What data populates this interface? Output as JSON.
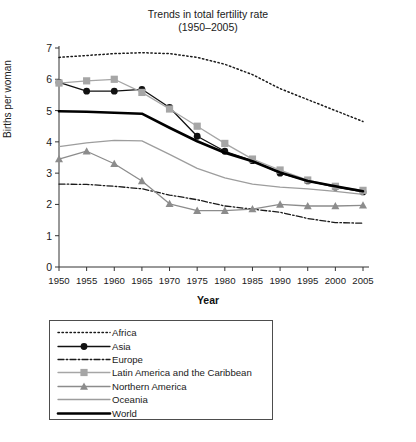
{
  "chart_data": {
    "type": "line",
    "title": "Trends in total fertility rate",
    "subtitle": "(1950–2005)",
    "xlabel": "Year",
    "ylabel": "Births per woman",
    "xlim": [
      1950,
      2005
    ],
    "ylim": [
      0,
      7
    ],
    "ytick_step": 1,
    "grid": false,
    "legend_position": "below-plot",
    "categories": [
      1950,
      1955,
      1960,
      1965,
      1970,
      1975,
      1980,
      1985,
      1990,
      1995,
      2000,
      2005
    ],
    "xtick_labels": [
      "1950",
      "1955",
      "1960",
      "1965",
      "1970",
      "1975",
      "1980",
      "1985",
      "1990",
      "1995",
      "2000",
      "2005"
    ],
    "ytick_labels": [
      "0",
      "1",
      "2",
      "3",
      "4",
      "5",
      "6",
      "7"
    ],
    "series": [
      {
        "name": "Africa",
        "style": "dotted",
        "color": "#1a1a1a",
        "marker": "none",
        "values": [
          6.7,
          6.76,
          6.82,
          6.85,
          6.82,
          6.7,
          6.48,
          6.15,
          5.7,
          5.35,
          5.0,
          4.65
        ]
      },
      {
        "name": "Asia",
        "style": "solid",
        "color": "#111111",
        "marker": "circle",
        "values": [
          5.9,
          5.62,
          5.62,
          5.68,
          5.1,
          4.18,
          3.7,
          3.4,
          3.0,
          2.75,
          2.55,
          2.4
        ]
      },
      {
        "name": "Europe",
        "style": "dash-dot",
        "color": "#1a1a1a",
        "marker": "none",
        "values": [
          2.65,
          2.64,
          2.58,
          2.5,
          2.3,
          2.15,
          1.95,
          1.85,
          1.75,
          1.55,
          1.42,
          1.4
        ]
      },
      {
        "name": "Latin America and the Caribbean",
        "style": "solid",
        "color": "#a6a6a6",
        "marker": "square",
        "values": [
          5.88,
          5.95,
          6.0,
          5.58,
          5.05,
          4.5,
          3.95,
          3.45,
          3.1,
          2.78,
          2.58,
          2.45
        ]
      },
      {
        "name": "Northern America",
        "style": "solid",
        "color": "#8c8c8c",
        "marker": "triangle",
        "values": [
          3.45,
          3.7,
          3.3,
          2.75,
          2.02,
          1.8,
          1.8,
          1.85,
          2.0,
          1.95,
          1.95,
          1.97
        ]
      },
      {
        "name": "Oceania",
        "style": "solid",
        "color": "#9d9d9d",
        "marker": "none",
        "values": [
          3.85,
          3.97,
          4.05,
          4.03,
          3.6,
          3.15,
          2.85,
          2.65,
          2.55,
          2.5,
          2.42,
          2.32
        ]
      },
      {
        "name": "World",
        "style": "solid-thick",
        "color": "#000000",
        "marker": "none",
        "values": [
          4.98,
          4.96,
          4.93,
          4.9,
          4.45,
          4.02,
          3.65,
          3.38,
          3.02,
          2.75,
          2.58,
          2.42
        ]
      }
    ]
  },
  "legend": {
    "items": [
      {
        "label": "Africa"
      },
      {
        "label": "Asia"
      },
      {
        "label": "Europe"
      },
      {
        "label": "Latin America and the Caribbean"
      },
      {
        "label": "Northern America"
      },
      {
        "label": "Oceania"
      },
      {
        "label": "World"
      }
    ]
  }
}
